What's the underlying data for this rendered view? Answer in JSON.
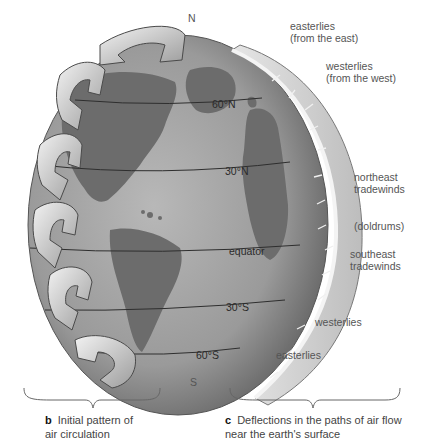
{
  "figure": {
    "pole_labels": {
      "north": "N",
      "south": "S"
    },
    "latitude_lines": [
      {
        "label": "60°N"
      },
      {
        "label": "30°N"
      },
      {
        "label": "equator"
      },
      {
        "label": "30°S"
      },
      {
        "label": "60°S"
      }
    ],
    "wind_labels": [
      {
        "line1": "easterlies",
        "line2": "(from the east)"
      },
      {
        "line1": "westerlies",
        "line2": "(from the west)"
      },
      {
        "line1": "northeast",
        "line2": "tradewinds"
      },
      {
        "line1": "(doldrums)"
      },
      {
        "line1": "southeast",
        "line2": "tradewinds"
      },
      {
        "line1": "westerlies"
      },
      {
        "line1": "easterlies"
      }
    ],
    "captions": {
      "b": {
        "letter": "b",
        "text1": "Initial pattern of",
        "text2": "air circulation"
      },
      "c": {
        "letter": "c",
        "text1": "Deflections in the paths of air flow",
        "text2": "near the earth's surface"
      }
    },
    "colors": {
      "ocean": "#a9a9a9",
      "land": "#6f6f6f",
      "arrows": "#d9d9d9",
      "shell": "#c8c8c8",
      "text": "#555555"
    }
  }
}
